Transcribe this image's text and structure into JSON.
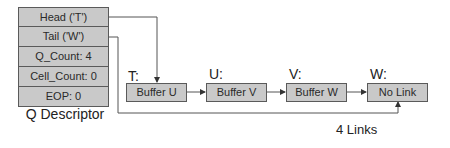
{
  "descriptor": {
    "title": "Q Descriptor",
    "fields": [
      {
        "label": "Head ('T')"
      },
      {
        "label": "Tail ('W')"
      },
      {
        "label": "Q_Count: 4"
      },
      {
        "label": "Cell_Count: 0"
      },
      {
        "label": "EOP: 0"
      }
    ]
  },
  "buffers": [
    {
      "address": "T:",
      "label": "Buffer U"
    },
    {
      "address": "U:",
      "label": "Buffer V"
    },
    {
      "address": "V:",
      "label": "Buffer W"
    },
    {
      "address": "W:",
      "label": "No Link"
    }
  ],
  "caption": "4 Links",
  "colors": {
    "fill": "#c9c9c9",
    "border": "#5a5a5a",
    "line": "#444444"
  }
}
